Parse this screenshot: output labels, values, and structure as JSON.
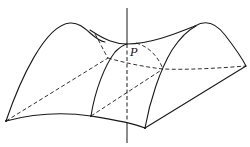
{
  "diagram": {
    "type": "saddle-surface",
    "labels": {
      "point": "P"
    },
    "colors": {
      "stroke": "#1a1a1a",
      "background": "#ffffff"
    }
  }
}
